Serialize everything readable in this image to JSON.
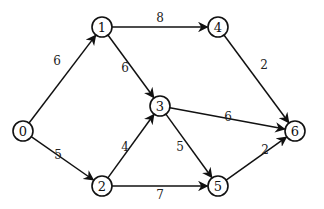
{
  "graph": {
    "type": "directed-weighted",
    "nodes": [
      {
        "id": "0",
        "label": "0",
        "x": 23,
        "y": 131
      },
      {
        "id": "1",
        "label": "1",
        "x": 102,
        "y": 27
      },
      {
        "id": "2",
        "label": "2",
        "x": 102,
        "y": 186
      },
      {
        "id": "3",
        "label": "3",
        "x": 160,
        "y": 106
      },
      {
        "id": "4",
        "label": "4",
        "x": 218,
        "y": 27
      },
      {
        "id": "5",
        "label": "5",
        "x": 218,
        "y": 186
      },
      {
        "id": "6",
        "label": "6",
        "x": 295,
        "y": 131
      }
    ],
    "edges": [
      {
        "from": "0",
        "to": "1",
        "weight": "6",
        "lx": 57,
        "ly": 61
      },
      {
        "from": "0",
        "to": "2",
        "weight": "5",
        "lx": 58,
        "ly": 155
      },
      {
        "from": "1",
        "to": "4",
        "weight": "8",
        "lx": 160,
        "ly": 18
      },
      {
        "from": "1",
        "to": "3",
        "weight": "6",
        "lx": 125,
        "ly": 68
      },
      {
        "from": "2",
        "to": "3",
        "weight": "4",
        "lx": 125,
        "ly": 147
      },
      {
        "from": "2",
        "to": "5",
        "weight": "7",
        "lx": 160,
        "ly": 195
      },
      {
        "from": "3",
        "to": "6",
        "weight": "6",
        "lx": 228,
        "ly": 117
      },
      {
        "from": "3",
        "to": "5",
        "weight": "5",
        "lx": 180,
        "ly": 147
      },
      {
        "from": "4",
        "to": "6",
        "weight": "2",
        "lx": 264,
        "ly": 65
      },
      {
        "from": "5",
        "to": "6",
        "weight": "2",
        "lx": 265,
        "ly": 150
      }
    ]
  }
}
